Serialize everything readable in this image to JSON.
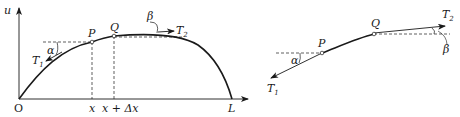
{
  "figure": {
    "left": {
      "axes": {
        "y_label": "u",
        "origin_label": "O",
        "end_label": "L"
      },
      "points": [
        {
          "name": "P",
          "x_label": "x"
        },
        {
          "name": "Q",
          "x_label": "x + Δx"
        }
      ],
      "forces": [
        {
          "name": "T",
          "sub": "1",
          "angle": "α"
        },
        {
          "name": "T",
          "sub": "2",
          "angle": "β"
        }
      ]
    },
    "right": {
      "points": [
        {
          "name": "P"
        },
        {
          "name": "Q"
        }
      ],
      "forces": [
        {
          "name": "T",
          "sub": "1",
          "angle": "α"
        },
        {
          "name": "T",
          "sub": "2",
          "angle": "β"
        }
      ]
    },
    "colors": {
      "ink": "#1a1a1a",
      "background": "#ffffff"
    }
  }
}
